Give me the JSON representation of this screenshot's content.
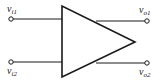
{
  "diagram": {
    "type": "differential-amplifier",
    "stroke_color": "#1a1a1a",
    "inputs": [
      {
        "symbol": "v",
        "subscript": "i1"
      },
      {
        "symbol": "v",
        "subscript": "i2"
      }
    ],
    "outputs": [
      {
        "symbol": "v",
        "subscript": "o1"
      },
      {
        "symbol": "v",
        "subscript": "o2"
      }
    ]
  }
}
